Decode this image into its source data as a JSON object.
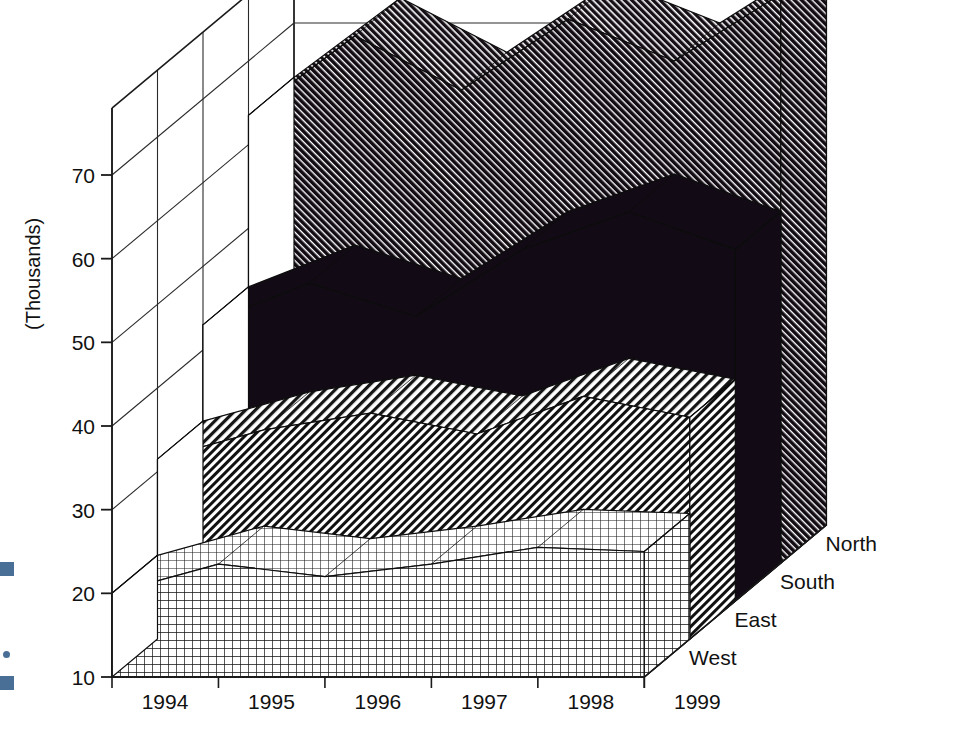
{
  "chart_data": {
    "type": "area",
    "subtype": "3d-stacked-area-surface",
    "title": "",
    "xlabel": "",
    "ylabel": "(Thousands)",
    "zlabel": "",
    "categories": [
      "1994",
      "1995",
      "1996",
      "1997",
      "1998",
      "1999"
    ],
    "x_tick_labels": [
      "1994",
      "1995",
      "1996",
      "1997",
      "1998",
      "1999"
    ],
    "y_tick_labels": [
      "10",
      "20",
      "30",
      "40",
      "50",
      "60",
      "70"
    ],
    "y_ticks": [
      10,
      20,
      30,
      40,
      50,
      60,
      70
    ],
    "ylim": [
      10,
      78
    ],
    "grid": true,
    "legend_position": "right-depth-axis",
    "depth_labels": [
      "North",
      "South",
      "East",
      "West"
    ],
    "series": [
      {
        "name": "West",
        "pattern": "crosshatch-grid",
        "values": [
          20.0,
          23.5,
          22.0,
          23.5,
          25.5,
          25.0
        ]
      },
      {
        "name": "East",
        "pattern": "diagonal-hatch-medium",
        "values": [
          31.5,
          35.0,
          37.0,
          34.5,
          39.0,
          36.5
        ]
      },
      {
        "name": "South",
        "pattern": "solid-black",
        "values": [
          43.0,
          48.0,
          44.0,
          52.0,
          56.5,
          52.0
        ]
      },
      {
        "name": "North",
        "pattern": "diagonal-hatch-dense",
        "values": [
          63.5,
          73.0,
          66.5,
          75.0,
          70.0,
          78.0
        ]
      }
    ]
  },
  "axes": {
    "y_axis_title": "(Thousands)",
    "y_labels": [
      "70",
      "60",
      "50",
      "40",
      "30",
      "20",
      "10"
    ],
    "x_labels": [
      "1994",
      "1995",
      "1996",
      "1997",
      "1998",
      "1999"
    ],
    "depth_axis_labels": [
      "North",
      "South",
      "East",
      "West"
    ]
  }
}
